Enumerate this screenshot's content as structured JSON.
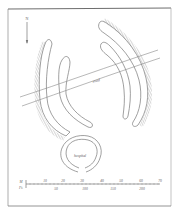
{
  "figure": {
    "type": "archaeological site plan",
    "north_label": "N",
    "labels": {
      "road": "road",
      "chapel": "hospital"
    },
    "scale_bar": {
      "metric_unit": "M",
      "imperial_unit": "Ft.",
      "metric_ticks": [
        "10",
        "20",
        "30",
        "40",
        "50",
        "60",
        "70"
      ],
      "imperial_ticks": [
        "50",
        "100",
        "150",
        "200"
      ]
    },
    "colors": {
      "line": "#7a7a7a",
      "hachure": "#8a8a8a",
      "frame": "#6e6e6e",
      "background": "#ffffff"
    }
  }
}
